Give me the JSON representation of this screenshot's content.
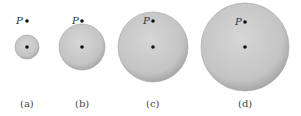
{
  "figure": {
    "point_label": "P",
    "panels": [
      {
        "id": "a",
        "caption": "(a)",
        "cx": 27,
        "cy": 47,
        "r": 12,
        "px": 27,
        "py": 21
      },
      {
        "id": "b",
        "caption": "(b)",
        "cx": 82,
        "cy": 47,
        "r": 23,
        "px": 82,
        "py": 21
      },
      {
        "id": "c",
        "caption": "(c)",
        "cx": 153,
        "cy": 47,
        "r": 35,
        "px": 153,
        "py": 21
      },
      {
        "id": "d",
        "caption": "(d)",
        "cx": 245,
        "cy": 47,
        "r": 44,
        "px": 245,
        "py": 22
      }
    ],
    "colors": {
      "sphere_fill": "#c8c8c8",
      "sphere_edge": "#9a9a9a",
      "dot": "#111111"
    }
  }
}
